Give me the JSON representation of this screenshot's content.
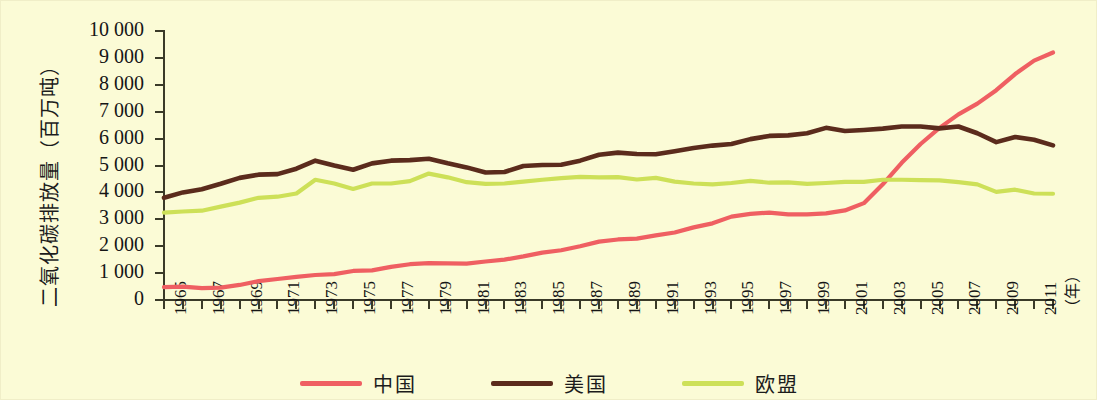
{
  "chart_data": {
    "type": "line",
    "title": "",
    "xlabel": "（年）",
    "ylabel": "二氧化碳排放量（百万吨）",
    "xlim": [
      1965,
      2012
    ],
    "ylim": [
      0,
      10000
    ],
    "grid": false,
    "legend_position": "bottom",
    "y_ticks": [
      "0",
      "1 000",
      "2 000",
      "3 000",
      "4 000",
      "5 000",
      "6 000",
      "7 000",
      "8 000",
      "9 000",
      "10 000"
    ],
    "y_tick_values": [
      0,
      1000,
      2000,
      3000,
      4000,
      5000,
      6000,
      7000,
      8000,
      9000,
      10000
    ],
    "x_tick_labels": [
      "1965",
      "1967",
      "1969",
      "1971",
      "1973",
      "1975",
      "1977",
      "1979",
      "1981",
      "1983",
      "1985",
      "1987",
      "1989",
      "1991",
      "1993",
      "1995",
      "1997",
      "1999",
      "2001",
      "2003",
      "2005",
      "2007",
      "2009",
      "2011"
    ],
    "x_tick_values": [
      1965,
      1967,
      1969,
      1971,
      1973,
      1975,
      1977,
      1979,
      1981,
      1983,
      1985,
      1987,
      1989,
      1991,
      1993,
      1995,
      1997,
      1999,
      2001,
      2003,
      2005,
      2007,
      2009,
      2011
    ],
    "x_axis_unit_label": "（年）",
    "x": [
      1965,
      1966,
      1967,
      1968,
      1969,
      1970,
      1971,
      1972,
      1973,
      1974,
      1975,
      1976,
      1977,
      1978,
      1979,
      1980,
      1981,
      1982,
      1983,
      1984,
      1985,
      1986,
      1987,
      1988,
      1989,
      1990,
      1991,
      1992,
      1993,
      1994,
      1995,
      1996,
      1997,
      1998,
      1999,
      2000,
      2001,
      2002,
      2003,
      2004,
      2005,
      2006,
      2007,
      2008,
      2009,
      2010,
      2011,
      2012
    ],
    "series": [
      {
        "name": "中国",
        "color": "#ef5f62",
        "values": [
          480,
          500,
          440,
          460,
          560,
          700,
          780,
          860,
          930,
          960,
          1080,
          1100,
          1230,
          1330,
          1370,
          1360,
          1350,
          1430,
          1500,
          1620,
          1760,
          1850,
          2000,
          2170,
          2250,
          2280,
          2400,
          2510,
          2700,
          2850,
          3100,
          3200,
          3250,
          3180,
          3180,
          3220,
          3330,
          3600,
          4300,
          5100,
          5800,
          6400,
          6900,
          7300,
          7800,
          8400,
          8900,
          9200
        ]
      },
      {
        "name": "美国",
        "color": "#5b2b1c",
        "values": [
          3800,
          4000,
          4120,
          4320,
          4540,
          4660,
          4680,
          4880,
          5180,
          5000,
          4840,
          5080,
          5180,
          5200,
          5250,
          5080,
          4930,
          4740,
          4760,
          4980,
          5020,
          5030,
          5180,
          5400,
          5480,
          5430,
          5420,
          5530,
          5650,
          5740,
          5800,
          5980,
          6100,
          6120,
          6200,
          6400,
          6280,
          6320,
          6370,
          6450,
          6450,
          6380,
          6450,
          6200,
          5870,
          6060,
          5960,
          5750
        ]
      },
      {
        "name": "欧盟",
        "color": "#cde058",
        "values": [
          3250,
          3290,
          3320,
          3470,
          3620,
          3800,
          3840,
          3960,
          4470,
          4330,
          4130,
          4330,
          4330,
          4420,
          4700,
          4560,
          4380,
          4320,
          4330,
          4400,
          4470,
          4530,
          4580,
          4560,
          4570,
          4480,
          4540,
          4400,
          4330,
          4300,
          4350,
          4430,
          4360,
          4370,
          4320,
          4350,
          4390,
          4390,
          4470,
          4470,
          4460,
          4450,
          4380,
          4300,
          4020,
          4100,
          3960,
          3950
        ]
      }
    ]
  },
  "legend": {
    "items": [
      {
        "label": "中国",
        "color": "#ef5f62"
      },
      {
        "label": "美国",
        "color": "#5b2b1c"
      },
      {
        "label": "欧盟",
        "color": "#cde058"
      }
    ]
  },
  "colors": {
    "background": "#fbfbd6",
    "axis": "#3a3a28",
    "text": "#151515",
    "china": "#ef5f62",
    "usa": "#5b2b1c",
    "eu": "#cde058"
  }
}
